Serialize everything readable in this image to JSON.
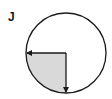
{
  "label": "J",
  "diagram": {
    "type": "circle-sector",
    "circle": {
      "cx": 66,
      "cy": 53,
      "r": 40
    },
    "shaded_sector": "bottom-left quarter",
    "fill_color": "#d9d9d9",
    "stroke_color": "#1a1a1a",
    "arrows": [
      {
        "from": "center",
        "direction": "left"
      },
      {
        "from": "center",
        "direction": "down"
      }
    ]
  }
}
